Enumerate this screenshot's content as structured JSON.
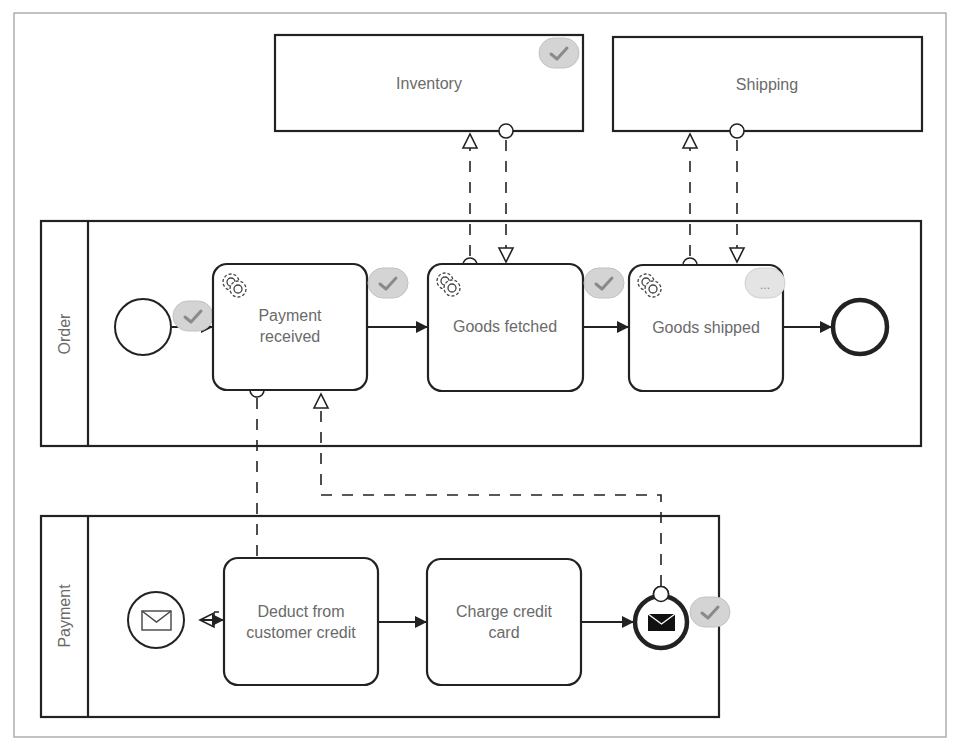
{
  "external_participants": [
    {
      "id": "inventory",
      "label": "Inventory",
      "status": "completed"
    },
    {
      "id": "shipping",
      "label": "Shipping",
      "status": "none"
    }
  ],
  "pools": {
    "order": {
      "label": "Order",
      "start_event": {
        "type": "none-start",
        "status": "completed"
      },
      "tasks": [
        {
          "label_line1": "Payment",
          "label_line2": "received",
          "type": "service-task",
          "icon": "gears-icon",
          "status": "completed"
        },
        {
          "label_line1": "Goods fetched",
          "label_line2": "",
          "type": "service-task",
          "icon": "gears-icon",
          "status": "completed"
        },
        {
          "label_line1": "Goods shipped",
          "label_line2": "",
          "type": "service-task",
          "icon": "gears-icon",
          "status": "in-progress"
        }
      ],
      "end_event": {
        "type": "none-end"
      }
    },
    "payment": {
      "label": "Payment",
      "start_event": {
        "type": "message-start",
        "icon": "envelope-icon"
      },
      "tasks": [
        {
          "label_line1": "Deduct from",
          "label_line2": "customer credit"
        },
        {
          "label_line1": "Charge credit",
          "label_line2": "card"
        }
      ],
      "end_event": {
        "type": "message-end",
        "icon": "envelope-filled-icon",
        "status": "completed"
      }
    }
  },
  "status_badges": {
    "completed_glyph": "check-icon",
    "in_progress_glyph": "ellipsis-icon",
    "in_progress_text": "..."
  },
  "colors": {
    "stroke": "#222222",
    "label": "#6a6a6a",
    "badge_completed": "#d4d4d4",
    "badge_in_progress": "#e4e4e4",
    "frame": "#9a9a9a"
  }
}
